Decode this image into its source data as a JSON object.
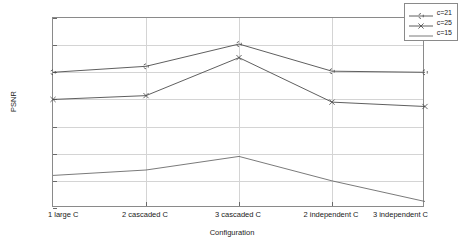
{
  "chart_data": {
    "type": "line",
    "title": "",
    "xlabel": "Configuration",
    "ylabel": "PSNR",
    "categories": [
      "1 large C",
      "2 cascaded C",
      "3 cascaded C",
      "2 independent C",
      "3 independent C"
    ],
    "ylim": [
      48,
      51.5
    ],
    "ytick_labels": [
      "48",
      "48.5",
      "49",
      "49.5",
      "50",
      "50.5",
      "51",
      "51.5"
    ],
    "ytick_values": [
      48,
      48.5,
      49,
      49.5,
      50,
      50.5,
      51,
      51.5
    ],
    "grid": true,
    "legend_position": "top-right",
    "series": [
      {
        "name": "c=21",
        "marker": "star",
        "color": "#4d4d4d",
        "values": [
          50.5,
          50.61,
          51.02,
          50.52,
          50.5
        ]
      },
      {
        "name": "c=25",
        "marker": "x",
        "color": "#4d4d4d",
        "values": [
          50.0,
          50.07,
          50.77,
          49.95,
          49.87
        ]
      },
      {
        "name": "c=15",
        "marker": "none",
        "color": "#6b6b6b",
        "values": [
          48.6,
          48.7,
          48.95,
          48.5,
          48.12
        ]
      }
    ]
  },
  "legend": {
    "entries": [
      {
        "label": "c=21"
      },
      {
        "label": "c=25"
      },
      {
        "label": "c=15"
      }
    ]
  },
  "axes": {
    "y_title": "PSNR",
    "x_title": "Configuration"
  },
  "colors": {
    "axis": "#8a8a8a",
    "grid": "#d4d4d4",
    "text": "#1a1a1a",
    "background": "#ffffff"
  }
}
